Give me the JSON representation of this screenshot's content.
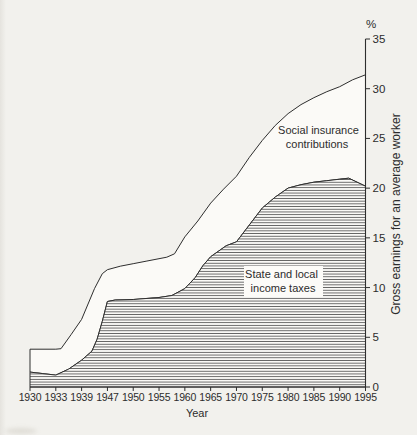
{
  "figure": {
    "background_color": "#f2f1ed",
    "line_color": "#2e2e2e",
    "hatch_color": "#4a4a4a",
    "area_fill_color": "#fbfaf7",
    "label_box_color": "#fcfbf8",
    "text_color": "#2c2c2c",
    "percent_symbol": "%"
  },
  "chart_data": {
    "type": "area",
    "stacked": true,
    "title": "",
    "xlabel": "Year",
    "ylabel": "Gross earnings for an average worker",
    "y_unit": "%",
    "ylim": [
      0,
      35
    ],
    "yticks": [
      0,
      5,
      10,
      15,
      20,
      25,
      30,
      35
    ],
    "grid": false,
    "legend_position": "none",
    "categories": [
      "1930",
      "1933",
      "1939",
      "1947",
      "1950",
      "1955",
      "1960",
      "1965",
      "1970",
      "1975",
      "1980",
      "1985",
      "1990",
      "1995"
    ],
    "series": [
      {
        "name": "State and local income taxes",
        "style": "hatched-area",
        "values": [
          1.5,
          1.2,
          2.7,
          8.6,
          8.8,
          9.0,
          9.9,
          13.1,
          14.6,
          18.0,
          20.0,
          20.6,
          20.9,
          20.2
        ]
      },
      {
        "name": "Social insurance contributions",
        "style": "white-band-between-curves",
        "note": "upper boundary of band = state and local income taxes plus social insurance contributions (cumulative total)",
        "upper_boundary_values": [
          3.8,
          3.8,
          6.8,
          11.8,
          12.4,
          12.9,
          15.1,
          18.5,
          21.2,
          24.8,
          27.5,
          29.1,
          30.2,
          31.4
        ]
      }
    ],
    "annotations": [
      {
        "lines": [
          "Social insurance",
          "contributions"
        ],
        "boxed": false
      },
      {
        "lines": [
          "State and local",
          "income taxes"
        ],
        "boxed": true
      }
    ],
    "shape_points": {
      "comment": "x in category-index units (ticks evenly spaced), y in percent; traced off the drawn curves",
      "upper": [
        [
          0,
          3.8
        ],
        [
          1,
          3.8
        ],
        [
          1.2,
          3.85
        ],
        [
          1.6,
          5.3
        ],
        [
          2,
          6.8
        ],
        [
          2.5,
          9.9
        ],
        [
          2.8,
          11.4
        ],
        [
          3,
          11.8
        ],
        [
          3.5,
          12.15
        ],
        [
          4,
          12.4
        ],
        [
          4.5,
          12.65
        ],
        [
          5,
          12.9
        ],
        [
          5.3,
          13.05
        ],
        [
          5.6,
          13.4
        ],
        [
          6,
          15.1
        ],
        [
          6.5,
          16.7
        ],
        [
          7,
          18.5
        ],
        [
          7.5,
          19.9
        ],
        [
          8,
          21.2
        ],
        [
          8.5,
          23.1
        ],
        [
          9,
          24.8
        ],
        [
          9.5,
          26.3
        ],
        [
          10,
          27.5
        ],
        [
          10.5,
          28.4
        ],
        [
          11,
          29.1
        ],
        [
          11.5,
          29.7
        ],
        [
          12,
          30.2
        ],
        [
          12.5,
          30.9
        ],
        [
          13,
          31.4
        ]
      ],
      "lower": [
        [
          0,
          1.5
        ],
        [
          0.5,
          1.35
        ],
        [
          1,
          1.2
        ],
        [
          1.5,
          1.8
        ],
        [
          2,
          2.7
        ],
        [
          2.4,
          3.6
        ],
        [
          2.6,
          4.8
        ],
        [
          2.8,
          6.6
        ],
        [
          3,
          8.6
        ],
        [
          3.3,
          8.75
        ],
        [
          4,
          8.8
        ],
        [
          5,
          9.0
        ],
        [
          5.5,
          9.2
        ],
        [
          6,
          9.9
        ],
        [
          6.4,
          11.0
        ],
        [
          6.7,
          12.2
        ],
        [
          7,
          13.1
        ],
        [
          7.6,
          14.2
        ],
        [
          8,
          14.6
        ],
        [
          8.5,
          16.3
        ],
        [
          9,
          18.0
        ],
        [
          9.5,
          19.1
        ],
        [
          10,
          20.0
        ],
        [
          10.5,
          20.35
        ],
        [
          11,
          20.6
        ],
        [
          11.5,
          20.75
        ],
        [
          12,
          20.9
        ],
        [
          12.35,
          21.0
        ],
        [
          13,
          20.2
        ]
      ]
    }
  }
}
